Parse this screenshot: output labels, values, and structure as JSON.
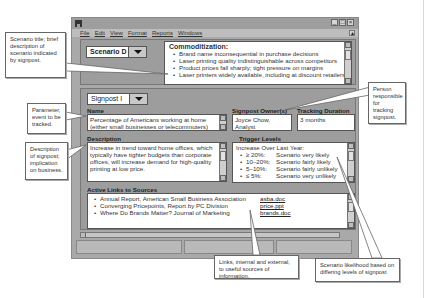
{
  "window": {
    "menu": [
      "File",
      "Edit",
      "View",
      "Format",
      "Reports",
      "Windows"
    ],
    "controls": [
      "minimize",
      "maximize",
      "close"
    ]
  },
  "scenario": {
    "selected": "Scenario D",
    "title": "Commoditization:",
    "bullets": [
      "Brand name inconsequential in purchase decisions",
      "Laser printing quality indistinguishable across competitors",
      "Product prices fall sharply; tight pressure on margins",
      "Laser printers widely available, including at discount retailers"
    ]
  },
  "signpost": {
    "selected": "Signpost I",
    "name_label": "Name",
    "name_value": "Percentage of Americans working at home (either small businesses or telecommuters)",
    "owner_label": "Signpost Owner(s)",
    "owner_value": "Joyce Chow, Analyst",
    "duration_label": "Tracking Duration",
    "duration_value": "3 months",
    "description_label": "Description",
    "description_value": "Increase in trend toward home offices, which typically have tighter budgets than corporate offices, will increase demand for high-quality printing at low price.",
    "trigger_label": "Trigger Levels",
    "trigger_heading": "Increase Over Last Year:",
    "triggers": [
      {
        "level": "≥ 20%:",
        "outcome": "Scenario very likely"
      },
      {
        "level": "10–20%:",
        "outcome": "Scenario fairly likely"
      },
      {
        "level": "5–10%:",
        "outcome": "Scenario fairly unlikely"
      },
      {
        "level": "≤ 5%:",
        "outcome": "Scenario very unlikely"
      }
    ],
    "links_label": "Active Links to Sources",
    "links": [
      {
        "title": "Annual Report, American Small Business Association",
        "file": "asba.doc"
      },
      {
        "title": "Converging Pricepoints, Report by PC Division",
        "file": "price.ppt"
      },
      {
        "title": "Where Do Brands Matter? Journal of Marketing",
        "file": "brands.doc"
      }
    ]
  },
  "callouts": {
    "scenario_title": "Scenario title; brief description of scenario indicated by signpost.",
    "parameter": "Parameter, event to be tracked.",
    "description": "Description of signpost; implication on business.",
    "person": "Person responsible for tracking signpost.",
    "links": "Links, internal and external, to useful sources of information.",
    "likelihood": "Scenario likelihood based on differing levels of signpost"
  }
}
